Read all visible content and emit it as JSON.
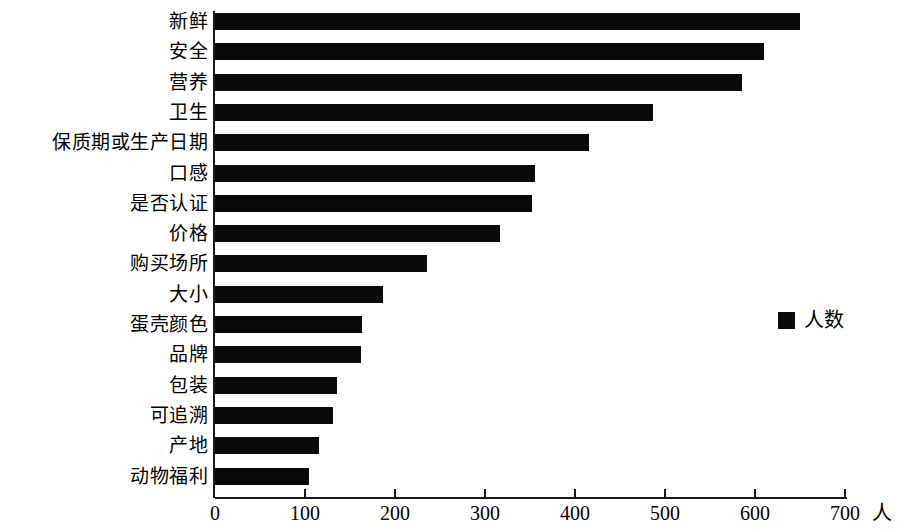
{
  "chart_data": {
    "type": "bar",
    "orientation": "horizontal",
    "title": "",
    "subtitle": "",
    "xlabel": "人",
    "ylabel": "",
    "xlim": [
      0,
      700
    ],
    "x_ticks": [
      0,
      100,
      200,
      300,
      400,
      500,
      600,
      700
    ],
    "x_tick_labels": [
      "0",
      "100",
      "200",
      "300",
      "400",
      "500",
      "600",
      "700"
    ],
    "grid": false,
    "legend": {
      "position": "right-middle",
      "entries": [
        {
          "label": "人数",
          "color": "#0a0a0a"
        }
      ]
    },
    "series": [
      {
        "name": "人数",
        "color": "#0a0a0a",
        "values": [
          650,
          610,
          585,
          487,
          415,
          355,
          352,
          317,
          236,
          187,
          163,
          162,
          136,
          131,
          116,
          104
        ]
      }
    ],
    "categories": [
      "新鲜",
      "安全",
      "营养",
      "卫生",
      "保质期或生产日期",
      "口感",
      "是否认证",
      "价格",
      "购买场所",
      "大小",
      "蛋壳颜色",
      "品牌",
      "包装",
      "可追溯",
      "产地",
      "动物福利"
    ]
  }
}
